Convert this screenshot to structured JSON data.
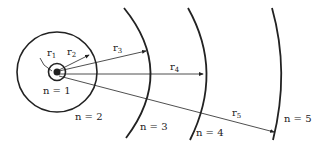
{
  "diagram": {
    "title": "",
    "orbits": [
      {
        "n": "n = 1",
        "radius_label": "r",
        "sub": "1"
      },
      {
        "n": "n = 2",
        "radius_label": "r",
        "sub": "2"
      },
      {
        "n": "n = 3",
        "radius_label": "r",
        "sub": "3"
      },
      {
        "n": "n = 4",
        "radius_label": "r",
        "sub": "4"
      },
      {
        "n": "n = 5",
        "radius_label": "r",
        "sub": "5"
      }
    ],
    "colors": {
      "line": "#222222",
      "background": "#ffffff"
    }
  }
}
